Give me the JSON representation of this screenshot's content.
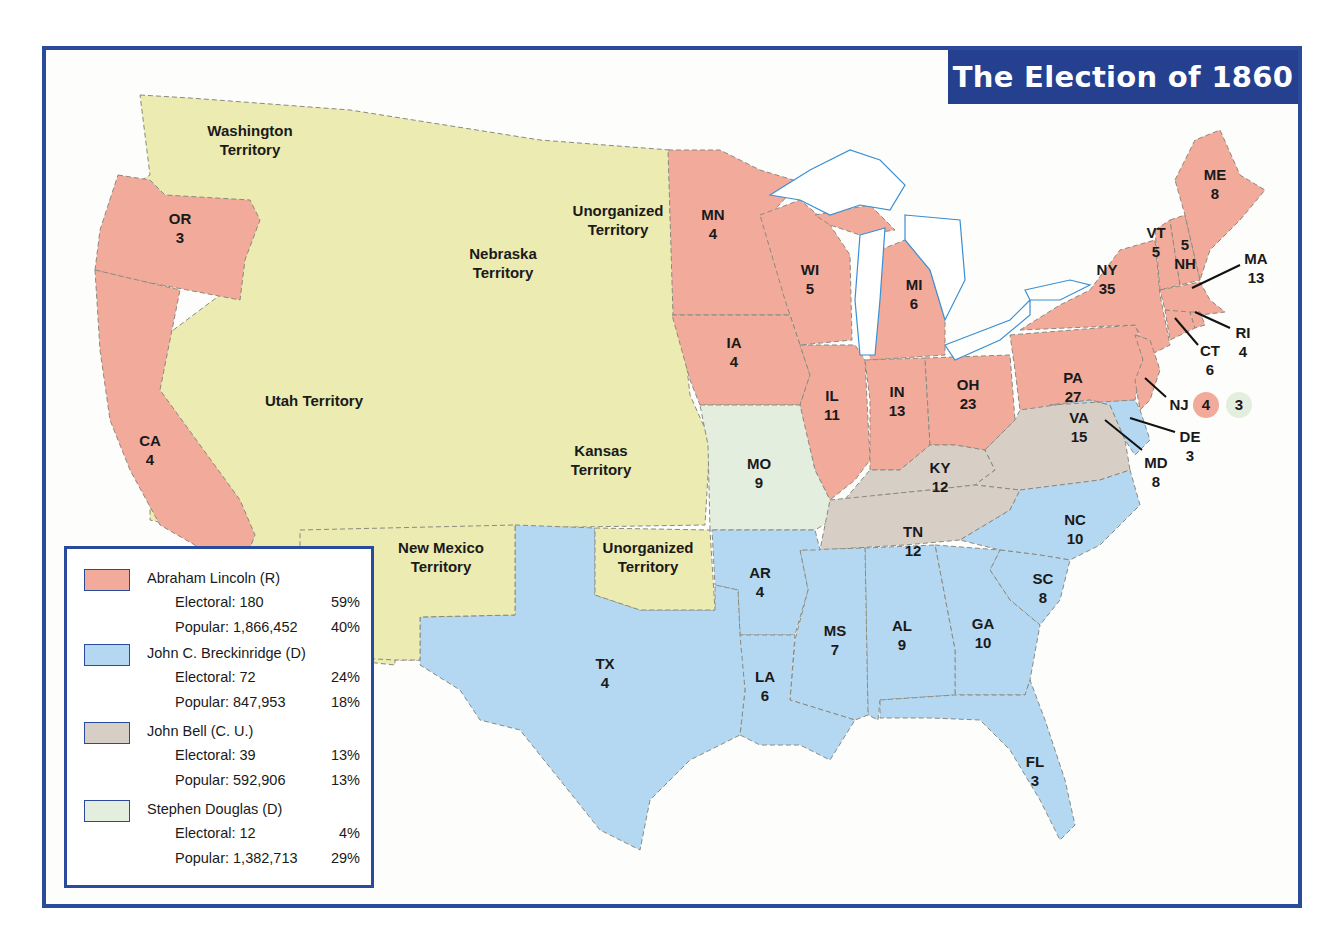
{
  "title": "The Election of 1860",
  "colors": {
    "lincoln": "#f2aa9a",
    "breckinridge": "#b5d8f2",
    "bell": "#d7cfc6",
    "douglas": "#e4eedf",
    "territory": "#ecebb1",
    "water": "#ffffff",
    "frame": "#2a4a9c"
  },
  "territories": [
    {
      "name": "Washington",
      "line2": "Territory"
    },
    {
      "name": "Nebraska",
      "line2": "Territory"
    },
    {
      "name": "Unorganized",
      "line2": "Territory"
    },
    {
      "name": "Utah Territory",
      "line2": ""
    },
    {
      "name": "Kansas",
      "line2": "Territory"
    },
    {
      "name": "New Mexico",
      "line2": "Territory"
    },
    {
      "name": "Unorganized",
      "line2": "Territory"
    }
  ],
  "states": {
    "OR": {
      "abbr": "OR",
      "ev": "3",
      "winner": "lincoln"
    },
    "CA": {
      "abbr": "CA",
      "ev": "4",
      "winner": "lincoln"
    },
    "MN": {
      "abbr": "MN",
      "ev": "4",
      "winner": "lincoln"
    },
    "IA": {
      "abbr": "IA",
      "ev": "4",
      "winner": "lincoln"
    },
    "WI": {
      "abbr": "WI",
      "ev": "5",
      "winner": "lincoln"
    },
    "MI": {
      "abbr": "MI",
      "ev": "6",
      "winner": "lincoln"
    },
    "IL": {
      "abbr": "IL",
      "ev": "11",
      "winner": "lincoln"
    },
    "IN": {
      "abbr": "IN",
      "ev": "13",
      "winner": "lincoln"
    },
    "OH": {
      "abbr": "OH",
      "ev": "23",
      "winner": "lincoln"
    },
    "PA": {
      "abbr": "PA",
      "ev": "27",
      "winner": "lincoln"
    },
    "NY": {
      "abbr": "NY",
      "ev": "35",
      "winner": "lincoln"
    },
    "VT": {
      "abbr": "VT",
      "ev": "5",
      "winner": "lincoln"
    },
    "NH": {
      "abbr": "NH",
      "ev": "5",
      "winner": "lincoln"
    },
    "ME": {
      "abbr": "ME",
      "ev": "8",
      "winner": "lincoln"
    },
    "MA": {
      "abbr": "MA",
      "ev": "13",
      "winner": "lincoln"
    },
    "RI": {
      "abbr": "RI",
      "ev": "4",
      "winner": "lincoln"
    },
    "CT": {
      "abbr": "CT",
      "ev": "6",
      "winner": "lincoln"
    },
    "NJ": {
      "abbr": "NJ",
      "ev_lincoln": "4",
      "ev_douglas": "3",
      "winner": "split"
    },
    "DE": {
      "abbr": "DE",
      "ev": "3",
      "winner": "breckinridge"
    },
    "MD": {
      "abbr": "MD",
      "ev": "8",
      "winner": "breckinridge"
    },
    "MO": {
      "abbr": "MO",
      "ev": "9",
      "winner": "douglas"
    },
    "KY": {
      "abbr": "KY",
      "ev": "12",
      "winner": "bell"
    },
    "VA": {
      "abbr": "VA",
      "ev": "15",
      "winner": "bell"
    },
    "TN": {
      "abbr": "TN",
      "ev": "12",
      "winner": "bell"
    },
    "NC": {
      "abbr": "NC",
      "ev": "10",
      "winner": "breckinridge"
    },
    "SC": {
      "abbr": "SC",
      "ev": "8",
      "winner": "breckinridge"
    },
    "GA": {
      "abbr": "GA",
      "ev": "10",
      "winner": "breckinridge"
    },
    "AL": {
      "abbr": "AL",
      "ev": "9",
      "winner": "breckinridge"
    },
    "MS": {
      "abbr": "MS",
      "ev": "7",
      "winner": "breckinridge"
    },
    "LA": {
      "abbr": "LA",
      "ev": "6",
      "winner": "breckinridge"
    },
    "AR": {
      "abbr": "AR",
      "ev": "4",
      "winner": "breckinridge"
    },
    "TX": {
      "abbr": "TX",
      "ev": "4",
      "winner": "breckinridge"
    },
    "FL": {
      "abbr": "FL",
      "ev": "3",
      "winner": "breckinridge"
    }
  },
  "legend": [
    {
      "candidate": "Abraham Lincoln (R)",
      "electoral_label": "Electoral: 180",
      "electoral_pct": "59%",
      "popular_label": "Popular: 1,866,452",
      "popular_pct": "40%"
    },
    {
      "candidate": "John C. Breckinridge (D)",
      "electoral_label": "Electoral: 72",
      "electoral_pct": "24%",
      "popular_label": "Popular: 847,953",
      "popular_pct": "18%"
    },
    {
      "candidate": "John Bell (C. U.)",
      "electoral_label": "Electoral: 39",
      "electoral_pct": "13%",
      "popular_label": "Popular: 592,906",
      "popular_pct": "13%"
    },
    {
      "candidate": "Stephen Douglas (D)",
      "electoral_label": "Electoral: 12",
      "electoral_pct": "4%",
      "popular_label": "Popular: 1,382,713",
      "popular_pct": "29%"
    }
  ]
}
